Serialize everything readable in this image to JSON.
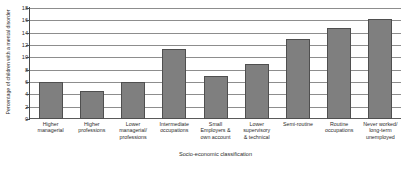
{
  "chart_data": {
    "type": "bar",
    "title": "",
    "xlabel": "Socio-economic classification",
    "ylabel": "Percentage of children with a mental disorder",
    "ylim": [
      0,
      18
    ],
    "yticks": [
      0,
      2,
      4,
      6,
      8,
      10,
      12,
      14,
      16,
      18
    ],
    "grid": true,
    "legend": false,
    "bar_color": "#7f7f7f",
    "bar_edge_color": "#4f4f4f",
    "categories": [
      "Higher managerial",
      "Higher professions",
      "Lower managerial/ professions",
      "Intermediate occupations",
      "Small Employers & own account",
      "Lower supervisory & technical",
      "Semi-routine",
      "Routine occupations",
      "Never worked/ long-term unemployed"
    ],
    "category_lines": [
      [
        "Higher",
        "managerial"
      ],
      [
        "Higher",
        "professions"
      ],
      [
        "Lower",
        "managerial/",
        "professions"
      ],
      [
        "Intermediate",
        "occupations"
      ],
      [
        "Small",
        "Employers &",
        "own account"
      ],
      [
        "Lower",
        "supervisory",
        "& technical"
      ],
      [
        "Semi-routine"
      ],
      [
        "Routine",
        "occupations"
      ],
      [
        "Never worked/",
        "long-term",
        "unemployed"
      ]
    ],
    "values": [
      6.0,
      4.6,
      6.0,
      11.3,
      7.0,
      9.0,
      12.9,
      14.8,
      16.2
    ]
  }
}
